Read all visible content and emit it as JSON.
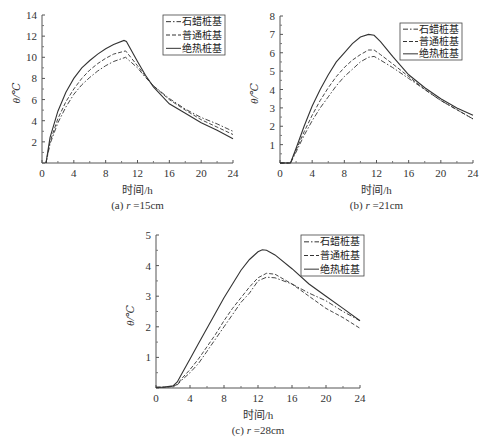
{
  "chart_data": [
    {
      "id": "a",
      "type": "line",
      "caption": "(a) r =15cm",
      "caption_prefix": "(a) ",
      "caption_var": "r",
      "caption_suffix": " =15cm",
      "xlabel": "时间/h",
      "ylabel": "θ/℃",
      "xlim": [
        0,
        24
      ],
      "ylim": [
        0,
        14
      ],
      "xticks": [
        0,
        4,
        8,
        12,
        16,
        20,
        24
      ],
      "yticks": [
        0,
        2,
        4,
        6,
        8,
        10,
        12,
        14
      ],
      "grid": false,
      "legend_position": "upper right",
      "frame": {
        "x0": 42,
        "x1": 233,
        "y0": 163,
        "y1": 15
      },
      "legend_box": {
        "x": 163,
        "y": 15,
        "w": 62,
        "h": 40
      },
      "series": [
        {
          "name": "石蜡桩基",
          "style": "dashdot",
          "x": [
            0.5,
            1,
            2,
            3,
            4,
            5,
            6,
            7,
            8,
            9,
            10.5,
            12,
            13,
            14,
            16,
            18,
            20,
            22,
            24
          ],
          "y": [
            0,
            1.8,
            3.8,
            5.3,
            6.5,
            7.4,
            8.1,
            8.7,
            9.2,
            9.6,
            10.0,
            9.0,
            8.1,
            7.3,
            6.1,
            5.1,
            4.3,
            3.7,
            3.0
          ]
        },
        {
          "name": "普通桩基",
          "style": "dashed",
          "x": [
            0.5,
            1,
            2,
            3,
            4,
            5,
            6,
            7,
            8,
            9,
            10.5,
            12,
            13,
            14,
            16,
            18,
            20,
            22,
            24
          ],
          "y": [
            0,
            2.0,
            4.2,
            5.8,
            7.0,
            8.0,
            8.8,
            9.4,
            9.9,
            10.3,
            10.6,
            9.2,
            8.2,
            7.3,
            6.0,
            5.0,
            4.1,
            3.4,
            2.7
          ]
        },
        {
          "name": "绝热桩基",
          "style": "solid",
          "x": [
            0.5,
            1,
            2,
            3,
            4,
            5,
            6,
            7,
            8,
            9,
            10.3,
            10.6,
            12,
            13,
            14,
            16,
            18,
            20,
            22,
            24
          ],
          "y": [
            0,
            2.4,
            4.9,
            6.7,
            8.0,
            9.0,
            9.7,
            10.3,
            10.8,
            11.2,
            11.6,
            11.5,
            9.6,
            8.3,
            7.2,
            5.6,
            4.7,
            3.8,
            3.1,
            2.3
          ]
        }
      ]
    },
    {
      "id": "b",
      "type": "line",
      "caption": "(b) r =21cm",
      "caption_prefix": "(b) ",
      "caption_var": "r",
      "caption_suffix": " =21cm",
      "xlabel": "时间/h",
      "ylabel": "θ/℃",
      "xlim": [
        0,
        24
      ],
      "ylim": [
        0,
        8
      ],
      "xticks": [
        0,
        4,
        8,
        12,
        16,
        20,
        24
      ],
      "yticks": [
        0,
        1,
        2,
        3,
        4,
        5,
        6,
        7,
        8
      ],
      "grid": false,
      "legend_position": "upper right",
      "frame": {
        "x0": 280,
        "x1": 473,
        "y0": 163,
        "y1": 16
      },
      "legend_box": {
        "x": 400,
        "y": 23,
        "w": 62,
        "h": 37
      },
      "series": [
        {
          "name": "石蜡桩基",
          "style": "dashdot",
          "x": [
            0,
            0.8,
            1.3,
            2,
            3,
            4,
            5,
            6,
            7,
            8,
            9,
            10,
            11,
            11.7,
            12.5,
            14,
            16,
            18,
            20,
            22,
            24
          ],
          "y": [
            0,
            0,
            0,
            0.6,
            1.5,
            2.3,
            3.0,
            3.6,
            4.2,
            4.7,
            5.1,
            5.5,
            5.75,
            5.8,
            5.6,
            5.2,
            4.6,
            4.0,
            3.4,
            2.9,
            2.4
          ]
        },
        {
          "name": "普通桩基",
          "style": "dashed",
          "x": [
            0,
            0.8,
            1.3,
            2,
            3,
            4,
            5,
            6,
            7,
            8,
            9,
            10,
            11,
            11.7,
            12.5,
            14,
            16,
            18,
            20,
            22,
            24
          ],
          "y": [
            0,
            0,
            0,
            0.7,
            1.7,
            2.6,
            3.4,
            4.1,
            4.7,
            5.2,
            5.6,
            5.9,
            6.15,
            6.15,
            5.9,
            5.4,
            4.7,
            4.0,
            3.4,
            2.9,
            2.4
          ]
        },
        {
          "name": "绝热桩基",
          "style": "solid",
          "x": [
            0,
            0.8,
            1.3,
            2,
            3,
            4,
            5,
            6,
            7,
            8,
            9,
            10,
            11,
            11.7,
            12.5,
            14,
            16,
            18,
            20,
            22,
            24
          ],
          "y": [
            0,
            0,
            0,
            0.8,
            2.0,
            3.1,
            4.0,
            4.8,
            5.5,
            6.0,
            6.5,
            6.85,
            7.0,
            6.95,
            6.6,
            5.8,
            4.8,
            4.1,
            3.5,
            3.0,
            2.6
          ]
        }
      ]
    },
    {
      "id": "c",
      "type": "line",
      "caption": "(c) r =28cm",
      "caption_prefix": "(c) ",
      "caption_var": "r",
      "caption_suffix": " =28cm",
      "xlabel": "时间/h",
      "ylabel": "θ/℃",
      "xlim": [
        0,
        24
      ],
      "ylim": [
        0,
        5
      ],
      "xticks": [
        0,
        4,
        8,
        12,
        16,
        20,
        24
      ],
      "yticks": [
        0,
        1,
        2,
        3,
        4,
        5
      ],
      "grid": false,
      "legend_position": "upper right",
      "frame": {
        "x0": 156,
        "x1": 360,
        "y0": 388,
        "y1": 235
      },
      "legend_box": {
        "x": 301,
        "y": 235,
        "w": 63,
        "h": 41
      },
      "series": [
        {
          "name": "石蜡桩基",
          "style": "dashdot",
          "x": [
            0,
            1,
            2,
            2.5,
            3,
            4,
            5,
            6,
            7,
            8,
            9,
            10,
            11,
            12,
            13,
            14,
            16,
            18,
            20,
            22,
            24
          ],
          "y": [
            0.02,
            0.03,
            0.05,
            0.1,
            0.25,
            0.5,
            0.8,
            1.2,
            1.6,
            2.0,
            2.4,
            2.8,
            3.1,
            3.5,
            3.62,
            3.6,
            3.4,
            3.1,
            2.85,
            2.5,
            2.2
          ]
        },
        {
          "name": "普通桩基",
          "style": "dashed",
          "x": [
            0,
            1,
            2,
            2.5,
            3,
            4,
            5,
            6,
            7,
            8,
            9,
            10,
            11,
            12,
            13,
            14,
            16,
            18,
            20,
            22,
            24
          ],
          "y": [
            0.02,
            0.03,
            0.05,
            0.12,
            0.3,
            0.6,
            0.95,
            1.35,
            1.75,
            2.2,
            2.6,
            2.95,
            3.3,
            3.6,
            3.75,
            3.72,
            3.4,
            3.0,
            2.6,
            2.3,
            1.95
          ]
        },
        {
          "name": "绝热桩基",
          "style": "solid",
          "x": [
            0,
            1,
            2,
            2.5,
            3,
            4,
            5,
            6,
            7,
            8,
            9,
            10,
            11,
            12,
            12.5,
            13,
            14,
            16,
            18,
            20,
            22,
            24
          ],
          "y": [
            0.02,
            0.03,
            0.07,
            0.2,
            0.45,
            0.95,
            1.45,
            1.95,
            2.45,
            2.95,
            3.4,
            3.85,
            4.2,
            4.45,
            4.52,
            4.5,
            4.35,
            3.9,
            3.4,
            3.0,
            2.6,
            2.2
          ]
        }
      ]
    }
  ]
}
